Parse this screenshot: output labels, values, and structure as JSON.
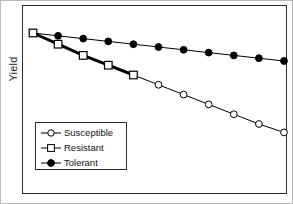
{
  "figure": {
    "ylabel": "Yield",
    "xlabel": "",
    "title": ""
  },
  "legend": {
    "position": "inside-lower-left",
    "entries": [
      {
        "label": "Susceptible",
        "marker": "open-circle-icon",
        "color": "#000000"
      },
      {
        "label": "Resistant",
        "marker": "open-square-icon",
        "color": "#000000"
      },
      {
        "label": "Tolerant",
        "marker": "filled-circle-icon",
        "color": "#000000"
      }
    ]
  },
  "chart_data": {
    "type": "line",
    "title": "",
    "xlabel": "",
    "ylabel": "Yield",
    "grid": false,
    "legend_position": "inside-lower-left",
    "axis_ticks": false,
    "axis_tick_labels": false,
    "xlim": [
      0,
      10
    ],
    "ylim": [
      0,
      100
    ],
    "x": [
      0,
      1,
      2,
      3,
      4,
      5,
      6,
      7,
      8,
      9,
      10
    ],
    "series": [
      {
        "name": "Susceptible",
        "marker": "open-circle",
        "line_width": 1,
        "values": [
          100,
          92,
          84,
          77,
          70,
          63,
          56,
          49,
          42,
          35,
          29
        ]
      },
      {
        "name": "Resistant",
        "marker": "open-square",
        "line_width": 3,
        "x": [
          0,
          1,
          2,
          3,
          4
        ],
        "values": [
          100,
          92,
          84,
          77,
          70
        ]
      },
      {
        "name": "Tolerant",
        "marker": "filled-circle",
        "line_width": 1,
        "values": [
          100,
          98,
          96,
          94,
          92,
          90,
          88,
          86,
          84,
          82,
          80
        ]
      }
    ]
  },
  "colors": {
    "line": "#000000",
    "frame": "#2a2a2a",
    "outer_border": "#b9b9b9",
    "background": "#ffffff"
  }
}
